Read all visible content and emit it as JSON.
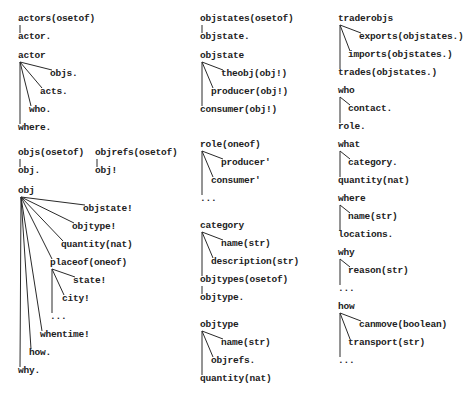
{
  "diagram": {
    "type": "schema-trees",
    "trees": [
      {
        "id": "actors",
        "root": "actors(osetof)",
        "children": [
          "actor."
        ]
      },
      {
        "id": "actor",
        "root": "actor",
        "children": [
          "objs.",
          "acts.",
          "who.",
          "where."
        ]
      },
      {
        "id": "objs",
        "root": "objs(osetof)",
        "children": [
          "obj."
        ]
      },
      {
        "id": "objrefs",
        "root": "objrefs(osetof)",
        "children": [
          "obj!"
        ]
      },
      {
        "id": "obj",
        "root": "obj",
        "children": [
          "objstate!",
          "objtype!",
          "quantity(nat)",
          "placeof(oneof)",
          "whentime!",
          "how.",
          "why."
        ],
        "subtree": {
          "placeof(oneof)": [
            "state!",
            "city!",
            "..."
          ]
        }
      },
      {
        "id": "objstates",
        "root": "objstates(osetof)",
        "children": [
          "objstate."
        ]
      },
      {
        "id": "objstate",
        "root": "objstate",
        "children": [
          "theobj(obj!)",
          "producer(obj!)",
          "consumer(obj!)"
        ]
      },
      {
        "id": "role",
        "root": "role(oneof)",
        "children": [
          "producer'",
          "consumer'",
          "..."
        ]
      },
      {
        "id": "category",
        "root": "category",
        "children": [
          "name(str)",
          "description(str)",
          "objtypes(osetof)"
        ],
        "subtree": {
          "objtypes(osetof)": [
            "objtype."
          ]
        }
      },
      {
        "id": "objtype",
        "root": "objtype",
        "children": [
          "name(str)",
          "objrefs.",
          "quantity(nat)"
        ]
      },
      {
        "id": "traderobjs",
        "root": "traderobjs",
        "children": [
          "exports(objstates.)",
          "imports(objstates.)",
          "trades(objstates.)"
        ]
      },
      {
        "id": "who",
        "root": "who",
        "children": [
          "contact.",
          "role."
        ]
      },
      {
        "id": "what",
        "root": "what",
        "children": [
          "category.",
          "quantity(nat)"
        ]
      },
      {
        "id": "where",
        "root": "where",
        "children": [
          "name(str)",
          "locations."
        ]
      },
      {
        "id": "why",
        "root": "why",
        "children": [
          "reason(str)",
          "..."
        ]
      },
      {
        "id": "how",
        "root": "how",
        "children": [
          "canmove(boolean)",
          "transport(str)",
          "..."
        ]
      }
    ]
  },
  "labels": {
    "c1": {
      "actors_root": "actors(osetof)",
      "actors_child": "actor.",
      "actor_root": "actor",
      "actor_objs": "objs.",
      "actor_acts": "acts.",
      "actor_who": "who.",
      "actor_where": "where.",
      "objs_root": "objs(osetof)",
      "objs_child": "obj.",
      "objrefs_root": "objrefs(osetof)",
      "objrefs_child": "obj!",
      "obj_root": "obj",
      "obj_objstate": "objstate!",
      "obj_objtype": "objtype!",
      "obj_quantity": "quantity(nat)",
      "obj_placeof": "placeof(oneof)",
      "placeof_state": "state!",
      "placeof_city": "city!",
      "placeof_more": "...",
      "obj_whentime": "whentime!",
      "obj_how": "how.",
      "obj_why": "why."
    },
    "c2": {
      "objstates_root": "objstates(osetof)",
      "objstates_child": "objstate.",
      "objstate_root": "objstate",
      "objstate_theobj": "theobj(obj!)",
      "objstate_producer": "producer(obj!)",
      "objstate_consumer": "consumer(obj!)",
      "role_root": "role(oneof)",
      "role_producer": "producer'",
      "role_consumer": "consumer'",
      "role_more": "...",
      "category_root": "category",
      "category_name": "name(str)",
      "category_description": "description(str)",
      "category_objtypes": "objtypes(osetof)",
      "objtypes_child": "objtype.",
      "objtype_root": "objtype",
      "objtype_name": "name(str)",
      "objtype_objrefs": "objrefs.",
      "objtype_quantity": "quantity(nat)"
    },
    "c3": {
      "traderobjs_root": "traderobjs",
      "traderobjs_exports": "exports(objstates.)",
      "traderobjs_imports": "imports(objstates.)",
      "traderobjs_trades": "trades(objstates.)",
      "who_root": "who",
      "who_contact": "contact.",
      "who_role": "role.",
      "what_root": "what",
      "what_category": "category.",
      "what_quantity": "quantity(nat)",
      "where_root": "where",
      "where_name": "name(str)",
      "where_locations": "locations.",
      "why_root": "why",
      "why_reason": "reason(str)",
      "why_more": "...",
      "how_root": "how",
      "how_canmove": "canmove(boolean)",
      "how_transport": "transport(str)",
      "how_more": "..."
    }
  }
}
